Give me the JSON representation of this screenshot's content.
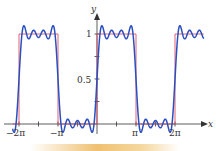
{
  "chart_data": {
    "type": "line",
    "title": "",
    "xlabel": "x",
    "ylabel": "y",
    "xlim": [
      -6.8,
      8.6
    ],
    "ylim": [
      -0.15,
      1.25
    ],
    "x_ticks": [
      {
        "value": -6.2832,
        "label": "−2π"
      },
      {
        "value": -4.7124,
        "label": ""
      },
      {
        "value": -3.1416,
        "label": "−π"
      },
      {
        "value": -1.5708,
        "label": ""
      },
      {
        "value": 1.5708,
        "label": ""
      },
      {
        "value": 3.1416,
        "label": "π"
      },
      {
        "value": 4.7124,
        "label": ""
      },
      {
        "value": 6.2832,
        "label": "2π"
      }
    ],
    "y_ticks": [
      {
        "value": 0.25,
        "label": ""
      },
      {
        "value": 0.5,
        "label": "0.5"
      },
      {
        "value": 0.75,
        "label": ""
      },
      {
        "value": 1,
        "label": "1"
      }
    ],
    "grid": false,
    "legend": null,
    "series": [
      {
        "name": "square wave f(x)",
        "color": "#e05060",
        "description": "f(x)=1 for 0<x<π, 0 for π<x<2π, period 2π",
        "x": [
          -6.8,
          -6.2832,
          -6.2832,
          -3.1416,
          -3.1416,
          0,
          0,
          3.1416,
          3.1416,
          6.2832,
          6.2832,
          8.6
        ],
        "y": [
          0,
          0,
          1,
          1,
          0,
          0,
          1,
          1,
          0,
          0,
          1,
          1
        ]
      },
      {
        "name": "Fourier partial sum",
        "color": "#2a4fc0",
        "description": "1/2 + (2/π)[sin x + sin3x/3 + sin5x/5 + sin7x/7]",
        "terms": 4
      }
    ]
  },
  "axes": {
    "x_label": "x",
    "y_label": "y",
    "x_tick_labels": [
      "−2π",
      "−π",
      "π",
      "2π"
    ],
    "y_tick_labels": [
      "1",
      "0.5"
    ]
  },
  "colors": {
    "square": "#e05060",
    "fourier": "#2a4fc0",
    "axis": "#333333"
  }
}
